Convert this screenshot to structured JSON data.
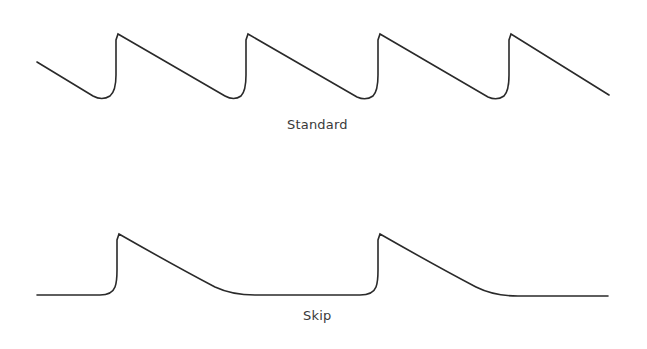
{
  "diagram": {
    "type": "waveform-comparison",
    "stroke_color": "#2a2a2a",
    "waveforms": [
      {
        "name": "standard",
        "label": "Standard",
        "description": "Repeating sawtooth: sharp vertical rise followed by linear ramp down with rounded trough",
        "peaks_x": [
          118,
          248,
          380,
          511
        ],
        "peak_y": 34,
        "trough_y": 98,
        "start": [
          37,
          62
        ],
        "end": [
          609,
          95
        ]
      },
      {
        "name": "skip",
        "label": "Skip",
        "description": "Pulse every other cycle: sharp rise, exponential-like decay to flat baseline",
        "peaks_x": [
          119,
          380
        ],
        "peak_y": 234,
        "baseline_y": 295,
        "start": [
          37,
          295
        ],
        "end": [
          608,
          296
        ]
      }
    ]
  }
}
